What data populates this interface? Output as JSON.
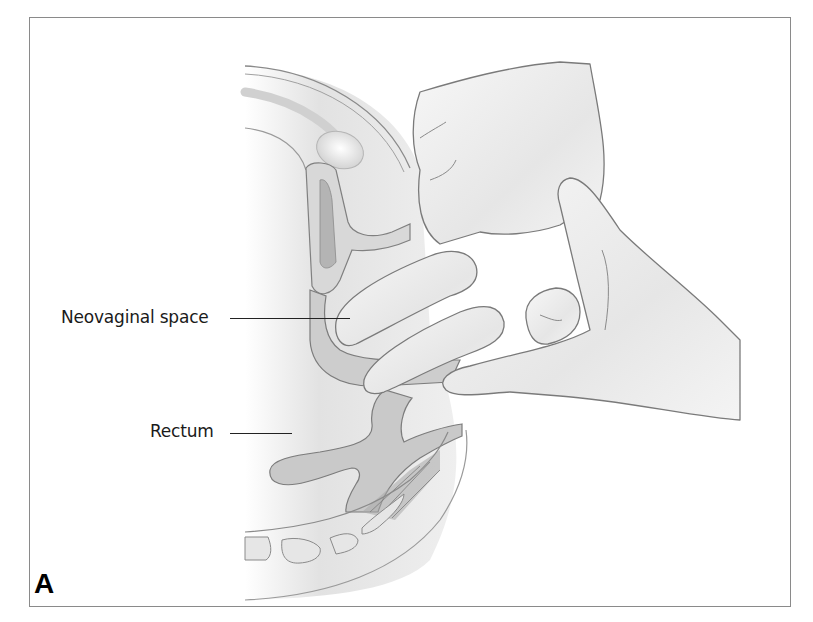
{
  "figure": {
    "panel_letter": "A",
    "labels": [
      {
        "text": "Neovaginal space",
        "points_to": "neovaginal-space"
      },
      {
        "text": "Rectum",
        "points_to": "rectum"
      }
    ]
  },
  "colors": {
    "frame": "#8a8a8a",
    "tissue_light": "#ececec",
    "tissue_mid": "#cfcfcf",
    "tissue_dark": "#9a9a9a",
    "outline": "#7a7a7a",
    "glove": "#f2f2f2",
    "text": "#1a1a1a"
  }
}
